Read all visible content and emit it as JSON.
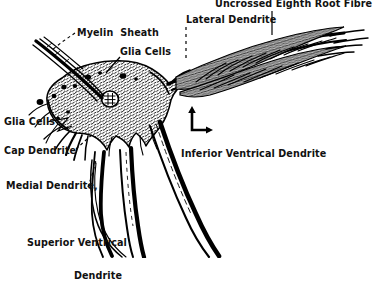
{
  "figure": {
    "kind": "hand-drawn neuroanatomy line illustration",
    "background_color": "#ffffff",
    "ink_color": "#000000"
  },
  "labels": {
    "uncrossed_eighth_root_fibre": "Uncrossed Eighth Root Fibre",
    "lateral_dendrite": "Lateral Dendrite",
    "myelin_sheath": "Myelin  Sheath",
    "glia_cells_top": "Glia Cells",
    "glia_cells_left": "Glia Cells",
    "cap_dendrite": "Cap Dendrite",
    "medial_dendrite": "Medial Dendrite,",
    "superior_ventrical_dendrite_line1": "Superior Ventrical",
    "superior_ventrical_dendrite_line2": "Dendrite",
    "inferior_ventrical_dendrite": "Inferior Ventrical Dendrite"
  },
  "orientation_marker": {
    "name": "axis-orientation-marker",
    "up_arrow": "↑",
    "right_arrow": "→"
  }
}
